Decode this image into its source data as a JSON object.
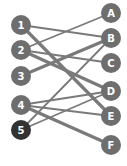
{
  "diagram": {
    "type": "bipartite-matching",
    "colors": {
      "node": "#6e6e6e",
      "node_highlight": "#333333",
      "edge": "#7a7a7a",
      "label": "#ffffff",
      "background": "#ffffff"
    },
    "left_nodes": [
      {
        "id": "1",
        "label": "1",
        "x": 21,
        "y": 25,
        "highlight": false
      },
      {
        "id": "2",
        "label": "2",
        "x": 21,
        "y": 50,
        "highlight": false
      },
      {
        "id": "3",
        "label": "3",
        "x": 21,
        "y": 76,
        "highlight": false
      },
      {
        "id": "4",
        "label": "4",
        "x": 21,
        "y": 105,
        "highlight": false
      },
      {
        "id": "5",
        "label": "5",
        "x": 21,
        "y": 130,
        "highlight": true
      }
    ],
    "right_nodes": [
      {
        "id": "A",
        "label": "A",
        "x": 111,
        "y": 13
      },
      {
        "id": "B",
        "label": "B",
        "x": 111,
        "y": 38
      },
      {
        "id": "C",
        "label": "C",
        "x": 111,
        "y": 63
      },
      {
        "id": "D",
        "label": "D",
        "x": 111,
        "y": 91
      },
      {
        "id": "E",
        "label": "E",
        "x": 111,
        "y": 116
      },
      {
        "id": "F",
        "label": "F",
        "x": 111,
        "y": 145
      }
    ],
    "edges": [
      {
        "from": "1",
        "to": "B",
        "thick": false
      },
      {
        "from": "1",
        "to": "E",
        "thick": true
      },
      {
        "from": "2",
        "to": "A",
        "thick": false
      },
      {
        "from": "2",
        "to": "C",
        "thick": false
      },
      {
        "from": "2",
        "to": "D",
        "thick": true
      },
      {
        "from": "3",
        "to": "B",
        "thick": true
      },
      {
        "from": "4",
        "to": "D",
        "thick": false
      },
      {
        "from": "4",
        "to": "E",
        "thick": false
      },
      {
        "from": "4",
        "to": "F",
        "thick": true
      },
      {
        "from": "5",
        "to": "B",
        "thick": false
      },
      {
        "from": "5",
        "to": "D",
        "thick": false
      }
    ],
    "node_radius": 10
  }
}
